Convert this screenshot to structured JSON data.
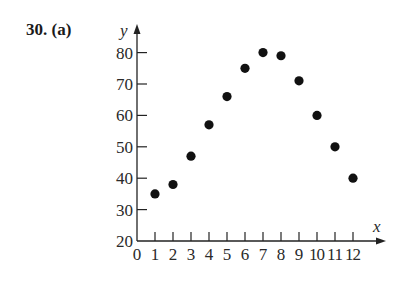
{
  "problem": {
    "label": "30.  (a)"
  },
  "chart_data": {
    "type": "scatter",
    "title": "",
    "xlabel": "x",
    "ylabel": "y",
    "xlim": [
      0,
      12
    ],
    "ylim": [
      20,
      80
    ],
    "x_ticks": [
      0,
      1,
      2,
      3,
      4,
      5,
      6,
      7,
      8,
      9,
      10,
      11,
      12
    ],
    "x_tick_labels": [
      "0",
      "1",
      "2",
      "3",
      "4",
      "5",
      "6",
      "7",
      "8",
      "9",
      "10",
      "11",
      "12"
    ],
    "y_ticks": [
      20,
      30,
      40,
      50,
      60,
      70,
      80
    ],
    "y_tick_labels": [
      "20",
      "30",
      "40",
      "50",
      "60",
      "70",
      "80"
    ],
    "grid": false,
    "legend": null,
    "x": [
      1,
      2,
      3,
      4,
      5,
      6,
      7,
      8,
      9,
      10,
      11,
      12
    ],
    "y": [
      35,
      38,
      47,
      57,
      66,
      75,
      80,
      79,
      71,
      60,
      50,
      40
    ],
    "marker_color": "#111111"
  }
}
